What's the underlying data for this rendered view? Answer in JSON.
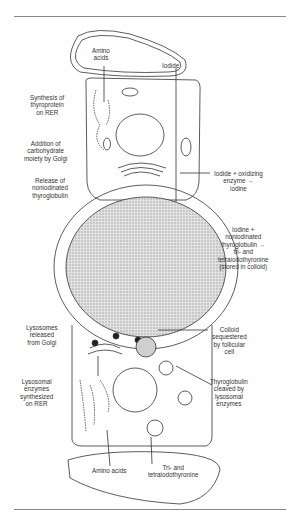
{
  "figure": {
    "colors": {
      "line": "#333333",
      "colloid": "#cfcfcf",
      "rule": "#888888"
    },
    "labels": {
      "amino_acids_top": "Amino\nacids",
      "iodide_top": "Iodide",
      "synthesis": "Synthesis of\nthyroprotein\non RER",
      "addition": "Addition of\ncarbohydrate\nmoiety by Golgi",
      "release": "Release of\nnoniodinated\nthyroglobulin",
      "iodide_oxidizing": "Iodide + oxidizing\nenzyme →\niodine",
      "iodine_noniodinated": "Iodine +\nnoniodinated\nthyroglobulin →\ntri- and\ntetraiodothyronine\n(stored in colloid)",
      "lysosomes": "Lysosomes\nreleased\nfrom Golgi",
      "colloid_sequestered": "Colloid\nsequestered\nby follicular\ncell",
      "lysosomal_enzymes": "Lysosomal\nenzymes\nsynthesized\non RER",
      "thyroglobulin_cleaved": "Thyroglobulin\ncleaved by\nlysosomal\nenzymes",
      "amino_acids_bottom": "Amino acids",
      "tri_tetra": "Tri- and\ntetraiodothyronine"
    }
  }
}
